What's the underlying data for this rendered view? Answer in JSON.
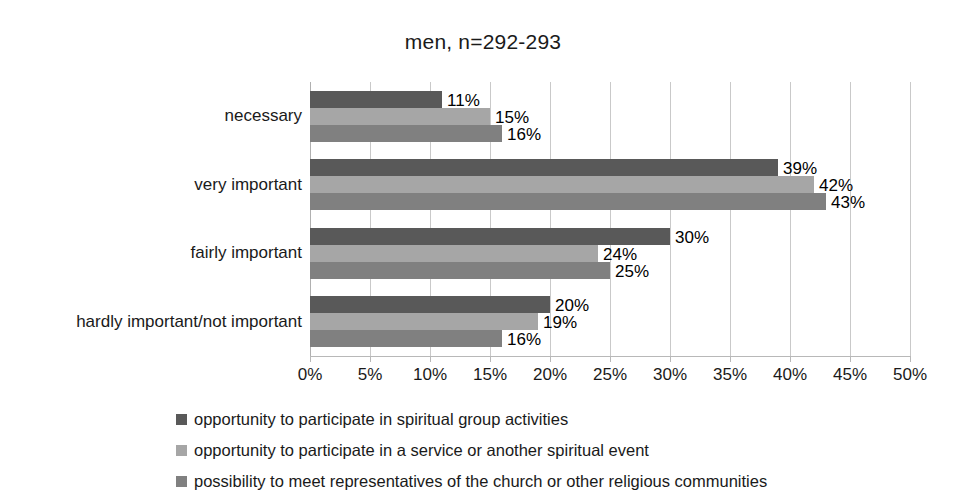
{
  "chart_data": {
    "type": "bar",
    "orientation": "horizontal",
    "title": "men, n=292-293",
    "xlabel": "",
    "ylabel": "",
    "xlim": [
      0,
      50
    ],
    "xtick_labels": [
      "0%",
      "5%",
      "10%",
      "15%",
      "20%",
      "25%",
      "30%",
      "35%",
      "40%",
      "45%",
      "50%"
    ],
    "xtick_values": [
      0,
      5,
      10,
      15,
      20,
      25,
      30,
      35,
      40,
      45,
      50
    ],
    "grid": true,
    "legend_position": "bottom",
    "categories": [
      "necessary",
      "very important",
      "fairly important",
      "hardly important/not important"
    ],
    "series": [
      {
        "name": "opportunity to participate in spiritual group activities",
        "color": "#595959",
        "values": [
          11,
          39,
          30,
          20
        ],
        "labels": [
          "11%",
          "39%",
          "30%",
          "20%"
        ]
      },
      {
        "name": "opportunity to participate in a service or another spiritual event",
        "color": "#a6a6a6",
        "values": [
          15,
          42,
          24,
          19
        ],
        "labels": [
          "15%",
          "42%",
          "24%",
          "19%"
        ]
      },
      {
        "name": "possibility to meet representatives of the church or other religious communities",
        "color": "#808080",
        "values": [
          16,
          43,
          25,
          16
        ],
        "labels": [
          "16%",
          "43%",
          "25%",
          "16%"
        ]
      }
    ]
  }
}
